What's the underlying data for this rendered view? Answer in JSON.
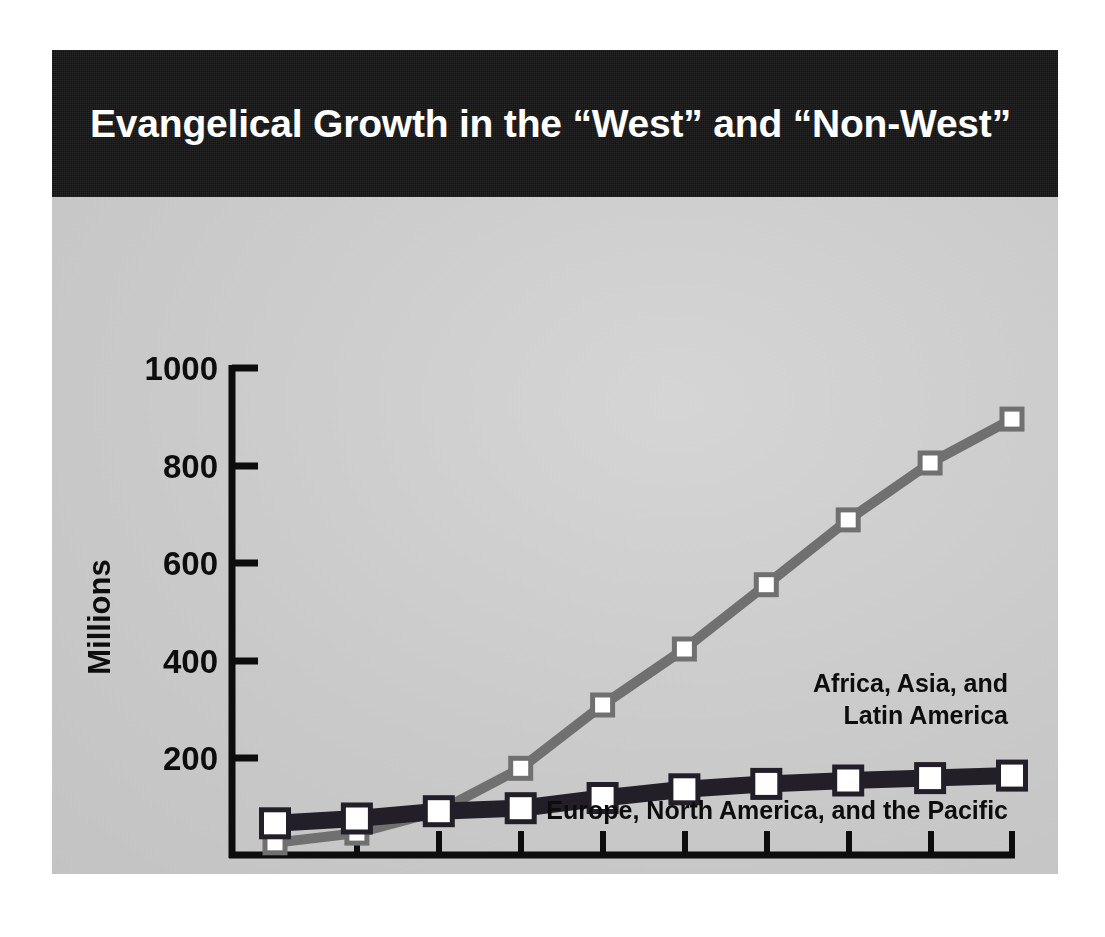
{
  "slide": {
    "title": "Evangelical Growth in the “West” and “Non-West”",
    "title_bar_color": "#141414",
    "body_color": "#c9c9c9"
  },
  "chart_data": {
    "type": "line",
    "title": "Evangelical Growth in the “West” and “Non-West”",
    "xlabel": "",
    "ylabel": "Millions",
    "categories": [
      "1960",
      "1970",
      "1980",
      "1990",
      "2000",
      "2010",
      "2020",
      "2030",
      "2040",
      "2050"
    ],
    "x": [
      1960,
      1970,
      1980,
      1990,
      2000,
      2010,
      2020,
      2030,
      2040,
      2050
    ],
    "ylim": [
      0,
      1000
    ],
    "xlim": [
      1960,
      2050
    ],
    "yticks": [
      200,
      400,
      600,
      800,
      1000
    ],
    "ytick_labels": [
      "200",
      "400",
      "600",
      "800",
      "1000"
    ],
    "grid": false,
    "legend": "inline-annotations",
    "series": [
      {
        "name": "Africa, Asia, and Latin America",
        "label_lines": [
          "Africa, Asia, and",
          "Latin America"
        ],
        "color": "#707070",
        "marker": "square-open",
        "values": [
          25,
          45,
          90,
          178,
          308,
          423,
          555,
          688,
          805,
          895
        ]
      },
      {
        "name": "Europe, North America, and the Pacific",
        "label_lines": [
          "Europe, North America, and the Pacific"
        ],
        "color": "#231f28",
        "marker": "square-open",
        "values": [
          65,
          75,
          90,
          96,
          117,
          135,
          146,
          153,
          158,
          163
        ]
      }
    ]
  },
  "axis": {
    "y_title": "Millions",
    "y_labels": [
      "1000",
      "800",
      "600",
      "400",
      "200"
    ],
    "x_labels": [
      "1960",
      "1970",
      "1980",
      "1990",
      "2000",
      "2010",
      "2020",
      "2030",
      "2040",
      "2050"
    ]
  },
  "annotations": {
    "series1_line1": "Africa, Asia, and",
    "series1_line2": "Latin America",
    "series2_line1": "Europe, North America, and the Pacific"
  },
  "colors": {
    "series_nonwest": "#707070",
    "series_west": "#231f28",
    "axis": "#0d0d0d",
    "marker_fill": "#ffffff",
    "panel_bg": "#c9c9c9",
    "title_bg": "#141414",
    "title_fg": "#ffffff",
    "page_bg": "#ffffff"
  }
}
